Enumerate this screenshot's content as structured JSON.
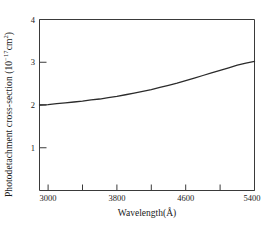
{
  "chart_data": {
    "type": "line",
    "title": "",
    "xlabel": "Wavelength(Å)",
    "ylabel_prefix": "Photodetachment  cross-section  (10",
    "ylabel_exp": "−17",
    "ylabel_mid": "cm",
    "ylabel_exp2": "2",
    "ylabel_suffix": ")",
    "ylabel_full": "Photodetachment  cross-section  (10−17cm2)",
    "xlim": [
      2900,
      5400
    ],
    "ylim": [
      0,
      4
    ],
    "grid": false,
    "legend": null,
    "xticks": [
      3000,
      3400,
      3800,
      4200,
      4600,
      5000,
      5400
    ],
    "xticklabels": [
      "3000",
      "",
      "3800",
      "",
      "4600",
      "",
      "5400"
    ],
    "yticks": [
      1,
      2,
      3,
      4
    ],
    "yticklabels": [
      "1",
      "2",
      "3",
      "4"
    ],
    "series": [
      {
        "name": "photodetachment cross-section",
        "x": [
          2900,
          3000,
          3100,
          3200,
          3300,
          3400,
          3500,
          3600,
          3700,
          3800,
          3900,
          4000,
          4100,
          4200,
          4300,
          4400,
          4500,
          4600,
          4700,
          4800,
          4900,
          5000,
          5100,
          5200,
          5300,
          5400
        ],
        "y": [
          2.0,
          2.01,
          2.03,
          2.05,
          2.07,
          2.09,
          2.12,
          2.14,
          2.17,
          2.2,
          2.24,
          2.28,
          2.32,
          2.36,
          2.41,
          2.46,
          2.51,
          2.57,
          2.63,
          2.69,
          2.75,
          2.81,
          2.87,
          2.93,
          2.98,
          3.02
        ]
      }
    ]
  },
  "axes": {
    "color_axis": "#3a3a3a",
    "color_curve": "#2b2b2b"
  }
}
